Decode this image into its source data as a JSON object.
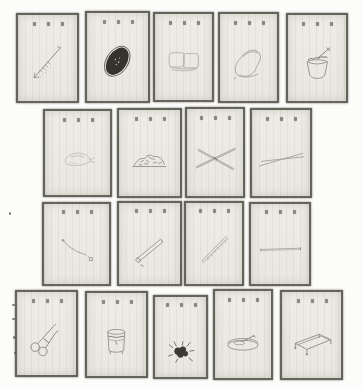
{
  "canvas": {
    "width": 363,
    "height": 388,
    "background_color": "#fcfcfa"
  },
  "palette": {
    "card_paper": "#ebeae5",
    "card_border": "#484640",
    "faint_ink": "#aba99f",
    "mid_ink": "#8d8b81",
    "dark_ink": "#37352e"
  },
  "cards": [
    {
      "id": "r1c1",
      "illustration": "arrow-pin",
      "x": 16,
      "y": 13,
      "w": 63,
      "h": 90,
      "title_mark_count": 3
    },
    {
      "id": "r1c2",
      "illustration": "dark-oval",
      "x": 85,
      "y": 11,
      "w": 65,
      "h": 92,
      "title_mark_count": 3
    },
    {
      "id": "r1c3",
      "illustration": "folded-box",
      "x": 153,
      "y": 12,
      "w": 61,
      "h": 90,
      "title_mark_count": 3
    },
    {
      "id": "r1c4",
      "illustration": "bell-pouch",
      "x": 218,
      "y": 12,
      "w": 61,
      "h": 91,
      "title_mark_count": 3
    },
    {
      "id": "r1c5",
      "illustration": "jar-with-stick",
      "x": 286,
      "y": 13,
      "w": 62,
      "h": 90,
      "title_mark_count": 3
    },
    {
      "id": "r2c1",
      "illustration": "shell-blob",
      "x": 43,
      "y": 109,
      "w": 69,
      "h": 88,
      "title_mark_count": 3
    },
    {
      "id": "r2c2",
      "illustration": "mound",
      "x": 117,
      "y": 108,
      "w": 65,
      "h": 90,
      "title_mark_count": 3
    },
    {
      "id": "r2c3",
      "illustration": "crossed-sticks",
      "x": 185,
      "y": 107,
      "w": 60,
      "h": 91,
      "title_mark_count": 3
    },
    {
      "id": "r2c4",
      "illustration": "chopsticks",
      "x": 250,
      "y": 108,
      "w": 62,
      "h": 90,
      "title_mark_count": 3
    },
    {
      "id": "r3c1",
      "illustration": "curved-cord",
      "x": 42,
      "y": 202,
      "w": 69,
      "h": 84,
      "title_mark_count": 3
    },
    {
      "id": "r3c2",
      "illustration": "round-stick",
      "x": 117,
      "y": 201,
      "w": 65,
      "h": 85,
      "title_mark_count": 3
    },
    {
      "id": "r3c3",
      "illustration": "hatched-stick",
      "x": 184,
      "y": 201,
      "w": 60,
      "h": 85,
      "title_mark_count": 3
    },
    {
      "id": "r3c4",
      "illustration": "flat-rod",
      "x": 249,
      "y": 202,
      "w": 62,
      "h": 84,
      "title_mark_count": 3
    },
    {
      "id": "r4c1",
      "illustration": "scissors",
      "x": 15,
      "y": 290,
      "w": 63,
      "h": 87,
      "title_mark_count": 3
    },
    {
      "id": "r4c2",
      "illustration": "bucket",
      "x": 85,
      "y": 291,
      "w": 63,
      "h": 87,
      "title_mark_count": 3
    },
    {
      "id": "r4c3",
      "illustration": "dark-cluster",
      "x": 153,
      "y": 295,
      "w": 55,
      "h": 84,
      "title_mark_count": 3,
      "ill_top": "34%"
    },
    {
      "id": "r4c4",
      "illustration": "tray-object",
      "x": 213,
      "y": 289,
      "w": 60,
      "h": 91,
      "title_mark_count": 3
    },
    {
      "id": "r4c5",
      "illustration": "low-table",
      "x": 280,
      "y": 290,
      "w": 63,
      "h": 90,
      "title_mark_count": 3
    }
  ],
  "speckles": [
    {
      "x": 9,
      "y": 212,
      "w": 2,
      "h": 3
    },
    {
      "x": 12,
      "y": 304,
      "w": 3,
      "h": 2
    },
    {
      "x": 12,
      "y": 318,
      "w": 3,
      "h": 2
    },
    {
      "x": 13,
      "y": 336,
      "w": 2,
      "h": 3
    },
    {
      "x": 14,
      "y": 352,
      "w": 2,
      "h": 2
    }
  ]
}
